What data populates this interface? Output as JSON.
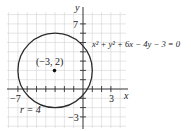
{
  "diagram": {
    "type": "circle-on-coordinate-plane",
    "equation": "x² + y² + 6x − 4y − 3 = 0",
    "center_label": "(−3, 2)",
    "radius_label": "r = 4",
    "axes": {
      "x_label": "x",
      "y_label": "y",
      "x_tick_labels": [
        "−7",
        "3"
      ],
      "y_tick_labels": [
        "7",
        "−3"
      ]
    },
    "center": [
      -3,
      2
    ],
    "radius": 4,
    "colors": {
      "grid": "#d4d4d4",
      "axis": "#333333",
      "circle": "#2a2a2a",
      "point": "#111111"
    }
  }
}
